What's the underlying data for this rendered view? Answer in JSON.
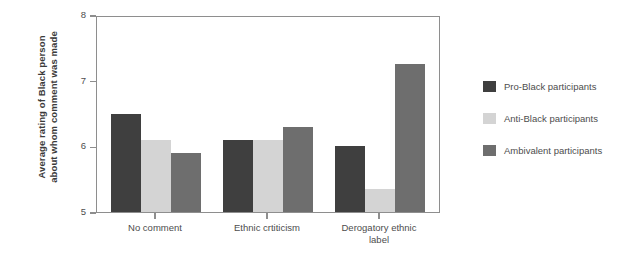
{
  "chart_data": {
    "type": "bar",
    "title": "",
    "xlabel": "",
    "ylabel": "Average rating of Black person\nabout whom comment was made",
    "ylabel_line1": "Average rating of Black person",
    "ylabel_line2": "about whom comment was made",
    "categories": [
      "No comment",
      "Ethnic crtiticism",
      "Derogatory ethnic\nlabel"
    ],
    "series": [
      {
        "name": "Pro-Black participants",
        "values": [
          6.5,
          6.1,
          6.0
        ],
        "color": "#3f3f3f"
      },
      {
        "name": "Anti-Black participants",
        "values": [
          6.1,
          6.1,
          5.35
        ],
        "color": "#d4d4d4"
      },
      {
        "name": "Ambivalent participants",
        "values": [
          5.9,
          6.3,
          7.25
        ],
        "color": "#6e6e6e"
      }
    ],
    "ylim": [
      5,
      8
    ],
    "yticks": [
      5,
      6,
      7,
      8
    ],
    "ytick_labels": [
      "5",
      "6",
      "7",
      "8"
    ],
    "grid": false,
    "legend_position": "right",
    "axis_color": "#8e8e8e",
    "background": "#ffffff"
  },
  "legend": {
    "items": [
      {
        "label": "Pro-Black participants",
        "color": "#3f3f3f"
      },
      {
        "label": "Anti-Black participants",
        "color": "#d4d4d4"
      },
      {
        "label": "Ambivalent participants",
        "color": "#6e6e6e"
      }
    ]
  }
}
